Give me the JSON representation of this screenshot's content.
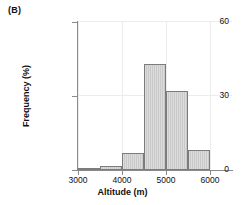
{
  "panel": {
    "label": "(B)"
  },
  "chart_data": {
    "type": "bar",
    "title": "",
    "subtitle": "",
    "xlabel": "Altitude (m)",
    "ylabel": "Frequency (%)",
    "xlim": [
      3000,
      6500
    ],
    "ylim": [
      0,
      60
    ],
    "xticks": [
      3000,
      4000,
      5000,
      6000
    ],
    "yticks": [
      0,
      30,
      60
    ],
    "xtick_labels": [
      "3000",
      "4000",
      "5000",
      "6000"
    ],
    "ytick_labels": [
      "0",
      "30",
      "60"
    ],
    "grid": true,
    "legend": null,
    "bin_width": 500,
    "bin_edges": [
      3000,
      3500,
      4000,
      4500,
      5000,
      5500,
      6000,
      6500
    ],
    "categories": [
      "3000-3500",
      "3500-4000",
      "4000-4500",
      "4500-5000",
      "5000-5500",
      "5500-6000",
      "6000-6500"
    ],
    "values": [
      0.5,
      1.5,
      7,
      43,
      32,
      8,
      0
    ],
    "bar_fill_color": "#c9c9c9",
    "bar_edge_color": "#7c7c7c",
    "axis_color": "#8a8a8a",
    "grid_color": "#ececec",
    "text_color": "#111111"
  }
}
